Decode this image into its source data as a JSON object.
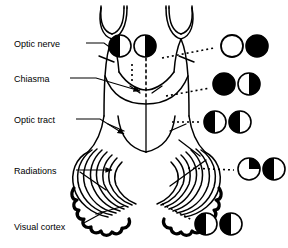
{
  "figure": {
    "ink_color": "#000000",
    "paper_color": "#ffffff"
  },
  "labels": [
    {
      "id": "optic-nerve",
      "text": "Optic nerve",
      "x": 14,
      "y": 39
    },
    {
      "id": "chiasma",
      "text": "Chiasma",
      "x": 14,
      "y": 74
    },
    {
      "id": "optic-tract",
      "text": "Optic tract",
      "x": 14,
      "y": 115
    },
    {
      "id": "radiations",
      "text": "Radiations",
      "x": 14,
      "y": 166
    },
    {
      "id": "visual-cortex",
      "text": "Visual cortex",
      "x": 14,
      "y": 222
    }
  ],
  "field_rows": [
    {
      "id": "row-optic-nerve",
      "lesion_site": "Optic nerve",
      "left": {
        "pattern": "half-left-black",
        "cx": 120,
        "cy": 46,
        "r": 11
      },
      "right": {
        "pattern": "half-right-black",
        "cx": 145,
        "cy": 46,
        "r": 11
      }
    },
    {
      "id": "row-chiasma-bitemporal",
      "lesion_site": "Chiasma",
      "left": {
        "pattern": "open",
        "cx": 232,
        "cy": 46,
        "r": 11
      },
      "right": {
        "pattern": "full-black",
        "cx": 257,
        "cy": 46,
        "r": 11
      }
    },
    {
      "id": "row-optic-tract",
      "lesion_site": "Optic tract",
      "left": {
        "pattern": "full-black",
        "cx": 224,
        "cy": 84,
        "r": 11
      },
      "right": {
        "pattern": "half-right-black",
        "cx": 249,
        "cy": 84,
        "r": 11
      }
    },
    {
      "id": "row-homonymous",
      "lesion_site": "Optic tract / posterior",
      "left": {
        "pattern": "half-left-black",
        "cx": 215,
        "cy": 122,
        "r": 11
      },
      "right": {
        "pattern": "half-left-black",
        "cx": 240,
        "cy": 122,
        "r": 11
      }
    },
    {
      "id": "row-quadrantanopia",
      "lesion_site": "Radiations",
      "left": {
        "pattern": "quadrant-upper-right-black",
        "cx": 249,
        "cy": 169,
        "r": 11
      },
      "right": {
        "pattern": "half-left-black",
        "cx": 274,
        "cy": 169,
        "r": 11
      }
    },
    {
      "id": "row-macular-sparing",
      "lesion_site": "Visual cortex",
      "left": {
        "pattern": "black-macular-spared",
        "cx": 206,
        "cy": 224,
        "r": 11
      },
      "right": {
        "pattern": "black-macular-spared",
        "cx": 231,
        "cy": 224,
        "r": 11
      }
    }
  ],
  "leaders": {
    "solid_arrows": [
      "optic-nerve",
      "chiasma",
      "optic-tract",
      "radiations"
    ],
    "dotted_pointers": [
      "visual-cortex",
      "nerve-field",
      "chiasma-field",
      "tract-field",
      "radiation-field",
      "cortex-field"
    ]
  }
}
